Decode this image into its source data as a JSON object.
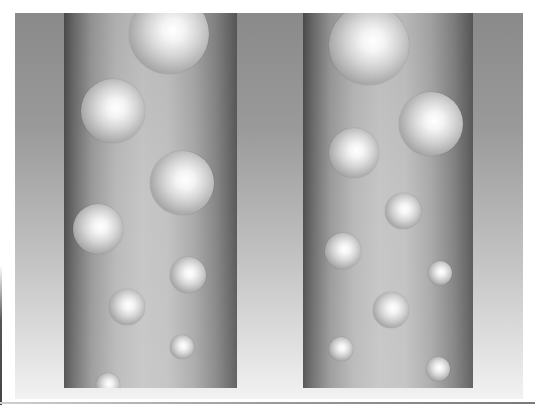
{
  "scene": {
    "description": "Two vertical cylindrical tubes with rising spherical bubbles on a gray gradient background",
    "frame": {
      "x": 15,
      "y": 13,
      "width": 508,
      "height": 386
    },
    "background_colors": {
      "top": "#8a8a8a",
      "bottom": "#f2f2f2"
    },
    "tube_colors": {
      "edge": "#4e4e4e",
      "center": "#c6c6c6"
    },
    "bubble_colors": {
      "highlight": "#ffffff",
      "rim": "#7a7a7a"
    }
  },
  "tubes": [
    {
      "id": "left",
      "x": 64,
      "y": 13,
      "width": 173,
      "height": 375,
      "bubbles": [
        {
          "cx": 169,
          "cy": 34,
          "r": 40
        },
        {
          "cx": 113,
          "cy": 111,
          "r": 32
        },
        {
          "cx": 182,
          "cy": 183,
          "r": 32
        },
        {
          "cx": 98,
          "cy": 229,
          "r": 25
        },
        {
          "cx": 188,
          "cy": 275,
          "r": 18
        },
        {
          "cx": 127,
          "cy": 307,
          "r": 18
        },
        {
          "cx": 182,
          "cy": 347,
          "r": 12
        },
        {
          "cx": 108,
          "cy": 385,
          "r": 12
        }
      ]
    },
    {
      "id": "right",
      "x": 303,
      "y": 13,
      "width": 170,
      "height": 375,
      "bubbles": [
        {
          "cx": 369,
          "cy": 45,
          "r": 40
        },
        {
          "cx": 431,
          "cy": 124,
          "r": 32
        },
        {
          "cx": 354,
          "cy": 153,
          "r": 25
        },
        {
          "cx": 403,
          "cy": 211,
          "r": 18
        },
        {
          "cx": 343,
          "cy": 251,
          "r": 18
        },
        {
          "cx": 440,
          "cy": 273,
          "r": 12
        },
        {
          "cx": 391,
          "cy": 310,
          "r": 18
        },
        {
          "cx": 341,
          "cy": 349,
          "r": 12
        },
        {
          "cx": 438,
          "cy": 369,
          "r": 12
        }
      ]
    }
  ]
}
